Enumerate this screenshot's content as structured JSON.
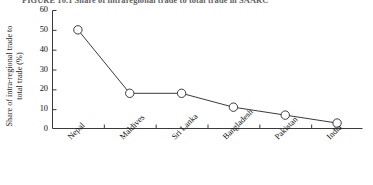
{
  "figure": {
    "caption": "FIGURE 10.1   Share of intraregional trade to total trade in SAARC"
  },
  "chart_data": {
    "type": "line",
    "title": "",
    "xlabel": "",
    "ylabel": "Share of intra-regional trade to total trade (%)",
    "ylabel_line1": "Share of intra-regional trade to",
    "ylabel_line2": "total trade (%)",
    "categories": [
      "Nepal",
      "Maldives",
      "Sri Lanka",
      "Bangladesh",
      "Pakistan",
      "India"
    ],
    "values": [
      50,
      18,
      18,
      11,
      7,
      3
    ],
    "ylim": [
      0,
      60
    ],
    "yticks": [
      0,
      10,
      20,
      30,
      40,
      50,
      60
    ],
    "ytick_labels": [
      "0",
      "10",
      "20",
      "30",
      "40",
      "50",
      "60"
    ],
    "grid": false,
    "legend": "none",
    "marker": "open-circle",
    "line_color": "#3a3a3a",
    "marker_fill": "#ffffff",
    "marker_edge": "#3a3a3a",
    "axis_color": "#3a3a3a"
  }
}
